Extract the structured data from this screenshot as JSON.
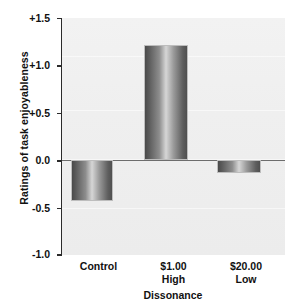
{
  "chart_data": {
    "type": "bar",
    "title": "",
    "xlabel": "Dissonance",
    "ylabel": "Ratings of task enjoyableness",
    "categories": [
      "Control",
      "$1.00",
      "$20.00"
    ],
    "category_sublabels": [
      "",
      "High",
      "Low"
    ],
    "values": [
      -0.43,
      1.22,
      -0.14
    ],
    "ylim": [
      -1.0,
      1.5
    ],
    "yticks": [
      1.5,
      1.0,
      0.5,
      0.0,
      -0.5,
      -1.0
    ],
    "ytick_labels": [
      "+1.5",
      "+1.0",
      "+0.5",
      "0.0",
      "-0.5",
      "-1.0"
    ],
    "grid": false,
    "legend": null,
    "zero_line": 0.0,
    "bar_color": "#8d8d8d",
    "plot_background": "#efefef"
  }
}
